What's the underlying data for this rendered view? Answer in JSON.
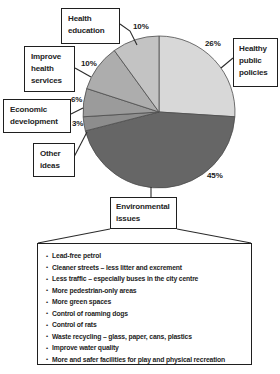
{
  "chart_data": {
    "type": "pie",
    "unit": "%",
    "start_angle_deg": 0,
    "direction": "clockwise",
    "center": {
      "cx": 159,
      "cy": 112,
      "r": 76
    },
    "slices": [
      {
        "id": "healthy-public-policies",
        "label": "Healthy public policies",
        "value": 26,
        "pct_label": "26%",
        "color": "#d8d8d8"
      },
      {
        "id": "environmental-issues",
        "label": "Environmental issues",
        "value": 45,
        "pct_label": "45%",
        "color": "#666666"
      },
      {
        "id": "other-ideas",
        "label": "Other ideas",
        "value": 3,
        "pct_label": "3%",
        "color": "#8d8d8d"
      },
      {
        "id": "economic-development",
        "label": "Economic development",
        "value": 6,
        "pct_label": "6%",
        "color": "#9b9b9b"
      },
      {
        "id": "improve-health-services",
        "label": "Improve health services",
        "value": 10,
        "pct_label": "10%",
        "color": "#adadad"
      },
      {
        "id": "health-education",
        "label": "Health education",
        "value": 10,
        "pct_label": "10%",
        "color": "#c3c3c3"
      }
    ]
  },
  "environmental_details": {
    "bullet_glyph": "•",
    "items": [
      "Lead-free petrol",
      "Cleaner streets – less litter and excrement",
      "Less traffic – especially buses in the city centre",
      "More pedestrian-only areas",
      "More green spaces",
      "Control of roaming dogs",
      "Control of rats",
      "Waste recycling – glass, paper, cans, plastics",
      "Improve water quality",
      "More and safer facilities for play and physical recreation"
    ]
  },
  "style": {
    "slice_stroke": "#4c4c4c",
    "line_color": "#2b2b2b"
  }
}
